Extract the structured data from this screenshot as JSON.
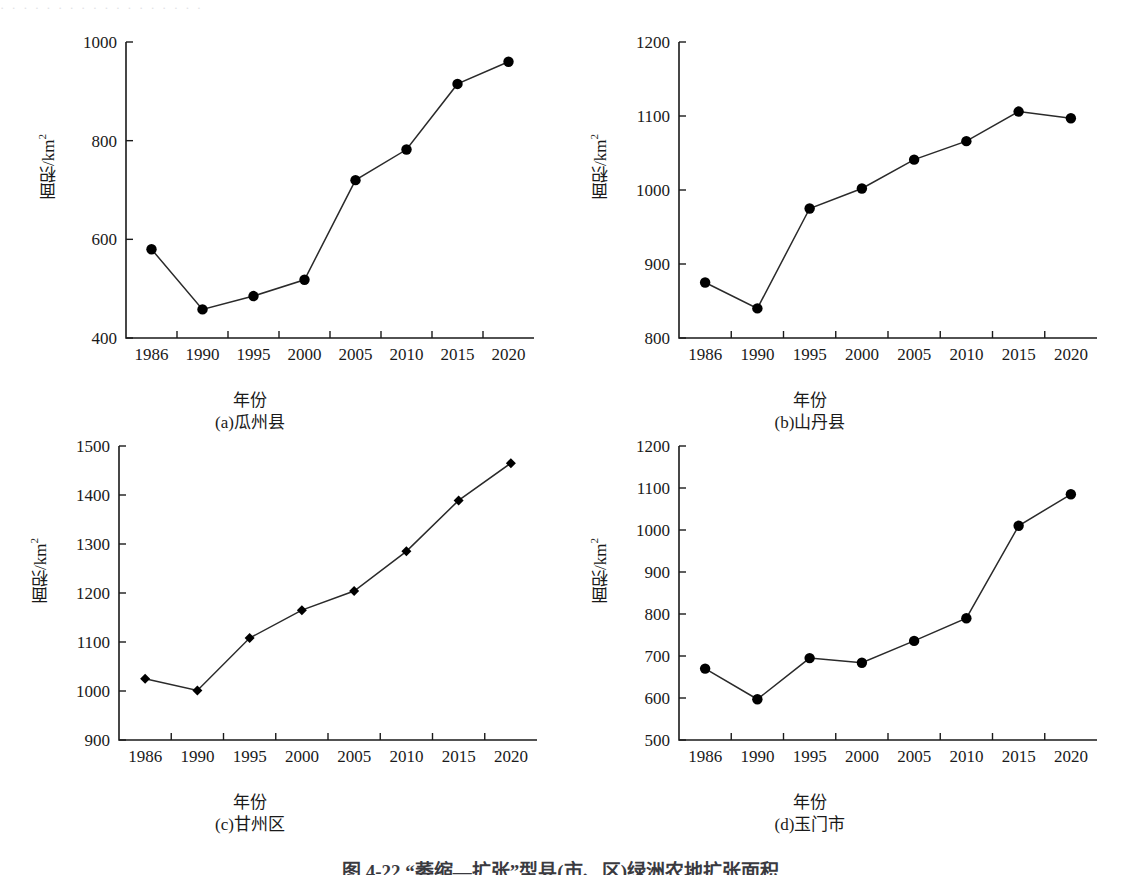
{
  "figure": {
    "caption": "图 4-22  “萎缩—扩张”型县(市、区)绿洲农地扩张面积",
    "top_artifact": "· · ·   · · · · ·   · ·          · ·  · ·  ·     ·       · ·"
  },
  "axis_common": {
    "xlabel": "年份",
    "ylabel_main": "面积/km",
    "ylabel_sup": "2",
    "xticklabels": [
      "1986",
      "1990",
      "1995",
      "2000",
      "2005",
      "2010",
      "2015",
      "2020"
    ]
  },
  "chart_data": [
    {
      "type": "line",
      "panel": "a",
      "caption": "(a)瓜州县",
      "title": "",
      "xlabel": "年份",
      "ylabel": "面积/km2",
      "marker": "circle",
      "grid": false,
      "legend": "none",
      "categories": [
        "1986",
        "1990",
        "1995",
        "2000",
        "2005",
        "2010",
        "2015",
        "2020"
      ],
      "values": [
        580,
        458,
        485,
        518,
        720,
        782,
        915,
        960
      ],
      "ylim": [
        400,
        1000
      ],
      "yticks": [
        400,
        600,
        800,
        1000
      ]
    },
    {
      "type": "line",
      "panel": "b",
      "caption": "(b)山丹县",
      "title": "",
      "xlabel": "年份",
      "ylabel": "面积/km2",
      "marker": "circle",
      "grid": false,
      "legend": "none",
      "categories": [
        "1986",
        "1990",
        "1995",
        "2000",
        "2005",
        "2010",
        "2015",
        "2020"
      ],
      "values": [
        875,
        840,
        975,
        1002,
        1041,
        1066,
        1106,
        1097
      ],
      "ylim": [
        800,
        1200
      ],
      "yticks": [
        800,
        900,
        1000,
        1100,
        1200
      ]
    },
    {
      "type": "line",
      "panel": "c",
      "caption": "(c)甘州区",
      "title": "",
      "xlabel": "年份",
      "ylabel": "面积/km2",
      "marker": "diamond",
      "grid": false,
      "legend": "none",
      "categories": [
        "1986",
        "1990",
        "1995",
        "2000",
        "2005",
        "2010",
        "2015",
        "2020"
      ],
      "values": [
        1025,
        1001,
        1108,
        1165,
        1204,
        1285,
        1389,
        1465
      ],
      "ylim": [
        900,
        1500
      ],
      "yticks": [
        900,
        1000,
        1100,
        1200,
        1300,
        1400,
        1500
      ]
    },
    {
      "type": "line",
      "panel": "d",
      "caption": "(d)玉门市",
      "title": "",
      "xlabel": "年份",
      "ylabel": "面积/km2",
      "marker": "circle",
      "grid": false,
      "legend": "none",
      "categories": [
        "1986",
        "1990",
        "1995",
        "2000",
        "2005",
        "2010",
        "2015",
        "2020"
      ],
      "values": [
        670,
        597,
        695,
        684,
        736,
        790,
        1010,
        1085
      ],
      "ylim": [
        500,
        1200
      ],
      "yticks": [
        500,
        600,
        700,
        800,
        900,
        1000,
        1100,
        1200
      ]
    }
  ]
}
